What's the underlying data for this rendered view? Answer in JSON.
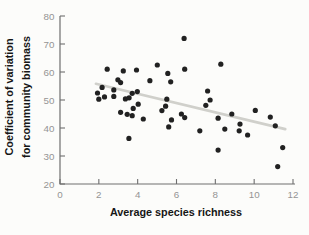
{
  "figure": {
    "background": "#fcfcfa"
  },
  "chart_data": {
    "type": "scatter",
    "title": "",
    "xlabel": "Average species richness",
    "ylabel_line1": "Coefficient of variation",
    "ylabel_line2": "for community biomass",
    "xlim": [
      0,
      12
    ],
    "ylim": [
      20,
      80
    ],
    "xticks": [
      0,
      2,
      4,
      6,
      8,
      10,
      12
    ],
    "yticks": [
      20,
      30,
      40,
      50,
      60,
      70,
      80
    ],
    "grid": false,
    "legend": "none",
    "point_color": "#212121",
    "trend_color": "#d0d0cb",
    "axis_color": "#6e6e6e",
    "tick_label_color": "#949494",
    "axis_label_color": "#161616",
    "points": [
      [
        2.43,
        61.0
      ],
      [
        3.26,
        60.4
      ],
      [
        3.94,
        60.7
      ],
      [
        2.98,
        57.2
      ],
      [
        3.12,
        56.2
      ],
      [
        4.63,
        56.9
      ],
      [
        5.01,
        62.5
      ],
      [
        5.55,
        59.5
      ],
      [
        5.7,
        56.5
      ],
      [
        2.17,
        54.5
      ],
      [
        2.77,
        53.6
      ],
      [
        3.72,
        52.4
      ],
      [
        3.98,
        53.0
      ],
      [
        1.93,
        52.5
      ],
      [
        2.0,
        50.3
      ],
      [
        2.29,
        51.1
      ],
      [
        2.77,
        51.3
      ],
      [
        3.37,
        50.4
      ],
      [
        3.56,
        50.8
      ],
      [
        4.03,
        48.5
      ],
      [
        3.77,
        47.0
      ],
      [
        3.12,
        45.6
      ],
      [
        3.46,
        44.9
      ],
      [
        3.72,
        44.4
      ],
      [
        4.29,
        43.2
      ],
      [
        5.5,
        50.3
      ],
      [
        5.44,
        47.8
      ],
      [
        5.25,
        46.2
      ],
      [
        5.74,
        42.9
      ],
      [
        6.25,
        45.0
      ],
      [
        6.42,
        43.7
      ],
      [
        5.6,
        40.4
      ],
      [
        3.55,
        36.3
      ],
      [
        6.39,
        72.0
      ],
      [
        6.42,
        61.0
      ],
      [
        8.28,
        62.8
      ],
      [
        7.6,
        53.2
      ],
      [
        7.73,
        50.0
      ],
      [
        7.51,
        48.1
      ],
      [
        8.85,
        45.0
      ],
      [
        8.14,
        43.5
      ],
      [
        7.2,
        39.0
      ],
      [
        8.49,
        39.6
      ],
      [
        9.27,
        41.4
      ],
      [
        9.23,
        39.0
      ],
      [
        9.66,
        37.5
      ],
      [
        8.14,
        32.1
      ],
      [
        10.06,
        46.3
      ],
      [
        10.83,
        43.9
      ],
      [
        11.09,
        40.8
      ],
      [
        11.47,
        33.0
      ],
      [
        11.21,
        26.2
      ]
    ],
    "trend_line": {
      "x1": 1.85,
      "y1": 55.8,
      "x2": 11.6,
      "y2": 39.6
    }
  }
}
